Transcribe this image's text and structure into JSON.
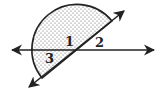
{
  "diagram": {
    "type": "geometry-angles",
    "lines": [
      {
        "name": "horizontal-line",
        "arrows": "both"
      },
      {
        "name": "diagonal-line",
        "arrows": "both"
      }
    ],
    "shaded_region": "semicircle above-left of diagonal line",
    "angle_labels": [
      {
        "id": "angle-1",
        "text": "1"
      },
      {
        "id": "angle-2",
        "text": "2"
      },
      {
        "id": "angle-3",
        "text": "3"
      }
    ],
    "colors": {
      "stroke": "#222222",
      "shading_dots": "#555555",
      "background": "#ffffff"
    }
  }
}
